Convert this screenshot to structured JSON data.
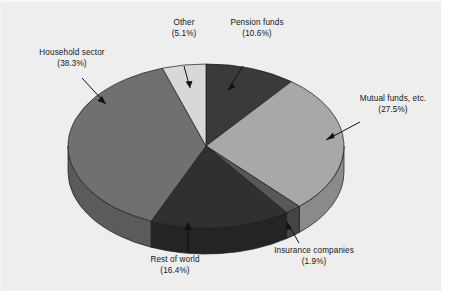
{
  "figure": {
    "background_color": "#eeeeee",
    "page_color": "#ffffff"
  },
  "chart_data": {
    "type": "pie",
    "title": "",
    "subtitle": "",
    "xlabel": "",
    "ylabel": "",
    "legend_position": "none",
    "grid": false,
    "style": "3d-pie",
    "units": "percent",
    "categories": [
      "Pension funds",
      "Mutual funds, etc.",
      "Insurance companies",
      "Rest of world",
      "Household sector",
      "Other"
    ],
    "values": [
      10.6,
      27.5,
      1.9,
      16.4,
      38.3,
      5.1
    ],
    "slices": [
      {
        "name": "pension-funds",
        "label": "Pension funds",
        "percent_text": "(10.6%)",
        "value": 10.6,
        "color": "#3a3a3a",
        "side_color": "#2b2b2b"
      },
      {
        "name": "mutual-funds",
        "label": "Mutual funds, etc.",
        "percent_text": "(27.5%)",
        "value": 27.5,
        "color": "#a8a8a8",
        "side_color": "#8a8a8a"
      },
      {
        "name": "insurance-companies",
        "label": "Insurance companies",
        "percent_text": "(1.9%)",
        "value": 1.9,
        "color": "#585858",
        "side_color": "#454545"
      },
      {
        "name": "rest-of-world",
        "label": "Rest of world",
        "percent_text": "(16.4%)",
        "value": 16.4,
        "color": "#303030",
        "side_color": "#242424"
      },
      {
        "name": "household-sector",
        "label": "Household sector",
        "percent_text": "(38.3%)",
        "value": 38.3,
        "color": "#707070",
        "side_color": "#5b5b5b"
      },
      {
        "name": "other",
        "label": "Other",
        "percent_text": "(5.1%)",
        "value": 5.1,
        "color": "#d8d8d8",
        "side_color": "#b4b4b4"
      }
    ]
  },
  "labels": {
    "other": {
      "text": "Other",
      "percent": "(5.1%)"
    },
    "pension": {
      "text": "Pension funds",
      "percent": "(10.6%)"
    },
    "household": {
      "text": "Household sector",
      "percent": "(38.3%)"
    },
    "mutual": {
      "text": "Mutual funds, etc.",
      "percent": "(27.5%)"
    },
    "insurance": {
      "text": "Insurance companies",
      "percent": "(1.9%)"
    },
    "rest": {
      "text": "Rest of world",
      "percent": "(16.4%)"
    }
  }
}
